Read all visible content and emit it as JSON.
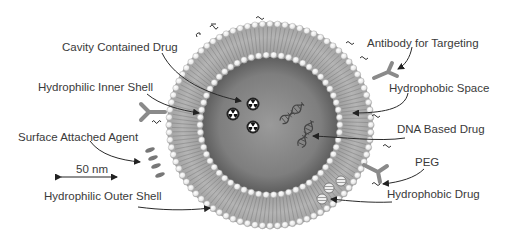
{
  "diagram": {
    "labels": {
      "cavity_drug": "Cavity Contained Drug",
      "inner_shell": "Hydrophilic Inner Shell",
      "surface_agent": "Surface Attached Agent",
      "scale_bar": "50 nm",
      "outer_shell": "Hydrophilic Outer Shell",
      "antibody": "Antibody for Targeting",
      "hydrophobic_space": "Hydrophobic Space",
      "dna_drug": "DNA Based Drug",
      "peg": "PEG",
      "hydrophobic_drug": "Hydrophobic Drug"
    },
    "colors": {
      "text": "#3a3a3a",
      "membrane": "#a8a8a8",
      "core": "#7a7a7a",
      "head_beads": "#f2f2f2",
      "arrows": "#2a2a2a"
    }
  }
}
